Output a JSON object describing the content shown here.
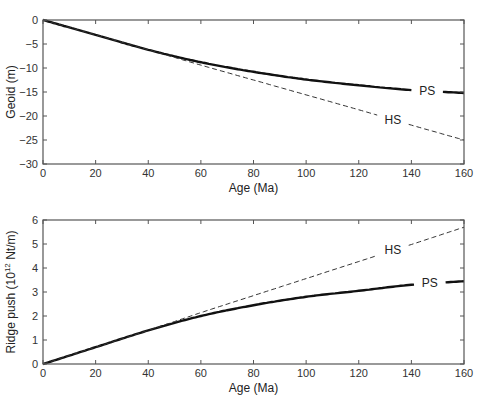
{
  "header": {
    "cropped_text": "…geoid…",
    "page_number": "…"
  },
  "chart_data": [
    {
      "type": "line",
      "title": "",
      "xlabel": "Age (Ma)",
      "ylabel": "Geoid (m)",
      "xlim": [
        0,
        160
      ],
      "ylim": [
        -30,
        0
      ],
      "xticks": [
        0,
        20,
        40,
        60,
        80,
        100,
        120,
        140,
        160
      ],
      "yticks": [
        0,
        -5,
        -10,
        -15,
        -20,
        -25,
        -30
      ],
      "ytick_labels": [
        "0",
        "−5",
        "−10",
        "−15",
        "−20",
        "−25",
        "−30"
      ],
      "grid": false,
      "x": [
        0,
        20,
        40,
        60,
        80,
        100,
        120,
        140,
        160
      ],
      "series": [
        {
          "name": "PS",
          "style": "solid",
          "values": [
            0,
            -3.1,
            -6.2,
            -8.8,
            -10.8,
            -12.4,
            -13.6,
            -14.6,
            -15.2
          ],
          "label_at": 146
        },
        {
          "name": "HS",
          "style": "dashed",
          "values": [
            0,
            -3.1,
            -6.2,
            -9.4,
            -12.5,
            -15.6,
            -18.7,
            -21.9,
            -25.0
          ],
          "label_at": 133
        }
      ]
    },
    {
      "type": "line",
      "title": "",
      "xlabel": "Age (Ma)",
      "ylabel": "Ridge push (10^12 Nt/m)",
      "xlim": [
        0,
        160
      ],
      "ylim": [
        0,
        6
      ],
      "xticks": [
        0,
        20,
        40,
        60,
        80,
        100,
        120,
        140,
        160
      ],
      "yticks": [
        0,
        1,
        2,
        3,
        4,
        5,
        6
      ],
      "ytick_labels": [
        "0",
        "1",
        "2",
        "3",
        "4",
        "5",
        "6"
      ],
      "grid": false,
      "x": [
        0,
        20,
        40,
        60,
        80,
        100,
        120,
        140,
        160
      ],
      "series": [
        {
          "name": "PS",
          "style": "solid",
          "values": [
            0,
            0.7,
            1.4,
            2.0,
            2.45,
            2.8,
            3.05,
            3.3,
            3.45
          ],
          "label_at": 147
        },
        {
          "name": "HS",
          "style": "dashed",
          "values": [
            0,
            0.7,
            1.4,
            2.14,
            2.85,
            3.56,
            4.27,
            4.98,
            5.7
          ],
          "label_at": 133
        }
      ]
    }
  ]
}
